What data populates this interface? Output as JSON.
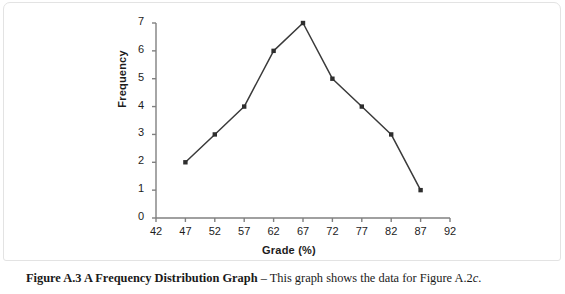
{
  "figure": {
    "caption_bold": "Figure A.3  A Frequency Distribution Graph",
    "caption_dash": " – ",
    "caption_rest": "This graph shows the data for Figure A.2",
    "caption_italic_suffix": "c",
    "caption_period": "."
  },
  "colors": {
    "axis": "#808080",
    "line": "#3a3a3a",
    "marker": "#2e2e2e",
    "text": "#1c1c1c",
    "card_background": "#ffffff",
    "card_border": "#e3e3e3"
  },
  "chart_data": {
    "type": "line",
    "title": "",
    "xlabel": "Grade (%)",
    "ylabel": "Frequency",
    "x": [
      47,
      52,
      57,
      62,
      67,
      72,
      77,
      82,
      87
    ],
    "values": [
      2,
      3,
      4,
      6,
      7,
      5,
      4,
      3,
      1
    ],
    "series": [
      {
        "name": "Frequency",
        "values": [
          2,
          3,
          4,
          6,
          7,
          5,
          4,
          3,
          1
        ]
      }
    ],
    "xlim": [
      42,
      92
    ],
    "ylim": [
      0,
      7
    ],
    "xticks": [
      42,
      47,
      52,
      57,
      62,
      67,
      72,
      77,
      82,
      87,
      92
    ],
    "yticks": [
      0,
      1,
      2,
      3,
      4,
      5,
      6,
      7
    ],
    "xtick_labels": [
      "42",
      "47",
      "52",
      "57",
      "62",
      "67",
      "72",
      "77",
      "82",
      "87",
      "92"
    ],
    "ytick_labels": [
      "0",
      "1",
      "2",
      "3",
      "4",
      "5",
      "6",
      "7"
    ],
    "grid": false,
    "legend": "none",
    "marker": "square",
    "annotations": []
  }
}
